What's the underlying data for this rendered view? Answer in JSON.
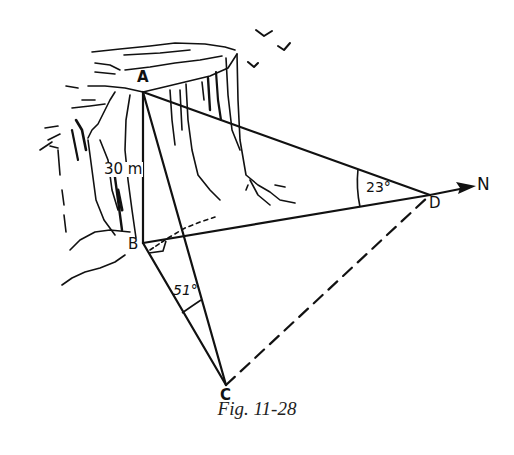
{
  "figure": {
    "caption": "Fig. 11-28",
    "points": {
      "A": {
        "label": "A",
        "x": 143,
        "y": 92
      },
      "B": {
        "label": "B",
        "x": 143,
        "y": 243
      },
      "C": {
        "label": "C",
        "x": 226,
        "y": 385
      },
      "D": {
        "label": "D",
        "x": 430,
        "y": 195
      }
    },
    "north": {
      "label": "N"
    },
    "measurements": {
      "height_AB": "30 m",
      "angle_ADB": "23°",
      "angle_ACB": "51°"
    },
    "segments": [
      {
        "from": "A",
        "to": "B",
        "style": "solid"
      },
      {
        "from": "A",
        "to": "C",
        "style": "solid"
      },
      {
        "from": "A",
        "to": "D",
        "style": "solid"
      },
      {
        "from": "B",
        "to": "C",
        "style": "solid"
      },
      {
        "from": "B",
        "to": "D",
        "style": "solid"
      },
      {
        "from": "C",
        "to": "D",
        "style": "dashed"
      }
    ],
    "right_angle_at": "B"
  }
}
